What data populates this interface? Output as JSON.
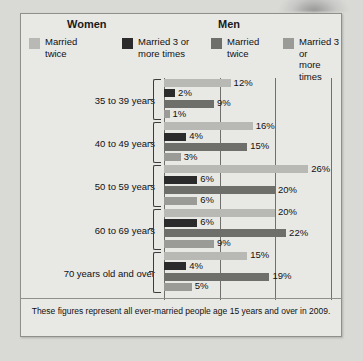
{
  "figure": {
    "section_headers": [
      {
        "name": "women",
        "label": "Women"
      },
      {
        "name": "men",
        "label": "Men"
      }
    ],
    "legend": [
      {
        "label": "Married\ntwice",
        "color": "#b8b8b4",
        "icon": "legend-swatch-women-twice"
      },
      {
        "label": "Married 3 or\nmore times",
        "color": "#2b2b2b",
        "icon": "legend-swatch-women-three-plus"
      },
      {
        "label": "Married\ntwice",
        "color": "#6e6e6b",
        "icon": "legend-swatch-men-twice"
      },
      {
        "label": "Married 3 or\nmore times",
        "color": "#9a9a97",
        "icon": "legend-swatch-men-three-plus"
      }
    ],
    "footnote": "These figures represent all ever-married people age 15 years and over in 2009."
  },
  "chart_data": {
    "type": "bar",
    "orientation": "horizontal",
    "title": "",
    "xlabel": "",
    "ylabel": "",
    "xlim": [
      0,
      30
    ],
    "gridlines": [
      0,
      10,
      20,
      30
    ],
    "grid": true,
    "legend_position": "top",
    "value_suffix": "%",
    "categories": [
      "35 to 39 years",
      "40 to 49 years",
      "50 to 59 years",
      "60 to 69 years",
      "70 years old and over"
    ],
    "series": [
      {
        "name": "Women — Married twice",
        "color": "#b8b8b4",
        "values": [
          12,
          16,
          26,
          20,
          15
        ]
      },
      {
        "name": "Women — Married 3 or more times",
        "color": "#2b2b2b",
        "values": [
          2,
          4,
          6,
          6,
          4
        ]
      },
      {
        "name": "Men — Married twice",
        "color": "#6e6e6b",
        "values": [
          9,
          15,
          20,
          22,
          19
        ]
      },
      {
        "name": "Men — Married 3 or more times",
        "color": "#9a9a97",
        "values": [
          1,
          3,
          6,
          9,
          5
        ]
      }
    ],
    "labels": [
      [
        "12%",
        "2%",
        "9%",
        "1%"
      ],
      [
        "16%",
        "4%",
        "15%",
        "3%"
      ],
      [
        "26%",
        "6%",
        "20%",
        "6%"
      ],
      [
        "20%",
        "6%",
        "22%",
        "9%"
      ],
      [
        "15%",
        "4%",
        "19%",
        "5%"
      ]
    ]
  }
}
